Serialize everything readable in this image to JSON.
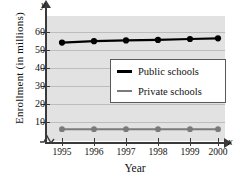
{
  "chart_data": {
    "type": "line",
    "title": "",
    "xlabel": "Year",
    "ylabel": "Enrollment (in millions)",
    "x_axis_variable": "x",
    "y_axis_variable": "y",
    "categories": [
      "1995",
      "1996",
      "1997",
      "1998",
      "1999",
      "2000"
    ],
    "x": [
      1995,
      1996,
      1997,
      1998,
      1999,
      2000
    ],
    "yticks": [
      10,
      20,
      30,
      40,
      50,
      60
    ],
    "ylim": [
      0,
      65
    ],
    "y_axis_break": true,
    "grid": true,
    "legend_position": "center-right",
    "series": [
      {
        "name": "Public schools",
        "color": "#000000",
        "values": [
          54.1,
          54.9,
          55.3,
          55.6,
          56.1,
          56.5
        ]
      },
      {
        "name": "Private schools",
        "color": "#7a7a7a",
        "values": [
          6.0,
          6.0,
          6.0,
          6.0,
          6.0,
          6.0
        ]
      }
    ]
  },
  "legend": {
    "items": [
      {
        "label": "Public schools"
      },
      {
        "label": "Private schools"
      }
    ]
  }
}
